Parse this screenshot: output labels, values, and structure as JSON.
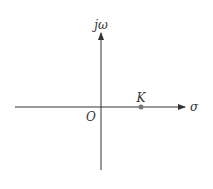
{
  "diagram": {
    "type": "s-plane",
    "vertical_axis_label": "jω",
    "horizontal_axis_label": "σ",
    "origin_label": "O",
    "point": {
      "label": "K",
      "position": "positive real axis"
    },
    "colors": {
      "axis": "#333333",
      "point": "#777777"
    }
  }
}
